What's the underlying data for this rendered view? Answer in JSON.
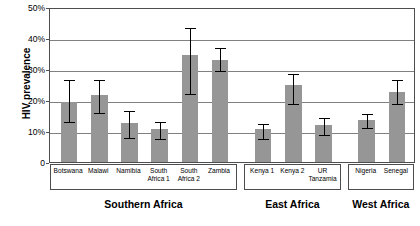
{
  "chart_data": {
    "type": "bar",
    "title": "",
    "xlabel": "",
    "ylabel": "HIV prevalence",
    "ylim": [
      0,
      50
    ],
    "ytick_labels": [
      "0",
      "10%",
      "20%",
      "30%",
      "40%",
      "50%"
    ],
    "ytick_values": [
      0,
      10,
      20,
      30,
      40,
      50
    ],
    "grid": true,
    "legend": "none",
    "units": "percent",
    "categories": [
      "Botswana",
      "Malawi",
      "Namibia",
      "South Africa 1",
      "South Africa 2",
      "Zambia",
      "Kenya 1",
      "Kenya 2",
      "UR Tanzamia",
      "Nigeria",
      "Senegal"
    ],
    "values": [
      19.5,
      21.5,
      12.5,
      10.5,
      34.5,
      33.0,
      10.5,
      25.0,
      12.0,
      13.5,
      22.5
    ],
    "error_low": [
      13.5,
      16.5,
      8.5,
      8.0,
      22.5,
      30.0,
      8.0,
      19.5,
      9.5,
      11.5,
      19.5
    ],
    "error_high": [
      27.0,
      27.0,
      17.0,
      13.5,
      44.0,
      37.5,
      13.0,
      29.0,
      15.0,
      16.0,
      27.0
    ],
    "groups": [
      {
        "label": "Southern Africa",
        "members": [
          "Botswana",
          "Malawi",
          "Namibia",
          "South Africa 1",
          "South Africa 2",
          "Zambia"
        ]
      },
      {
        "label": "East Africa",
        "members": [
          "Kenya 1",
          "Kenya 2",
          "UR Tanzamia"
        ]
      },
      {
        "label": "West Africa",
        "members": [
          "Nigeria",
          "Senegal"
        ]
      }
    ]
  },
  "labels": {
    "categories_display": [
      {
        "line1": "Botswana",
        "line2": ""
      },
      {
        "line1": "Malawi",
        "line2": ""
      },
      {
        "line1": "Namibia",
        "line2": ""
      },
      {
        "line1": "South",
        "line2": "Africa 1"
      },
      {
        "line1": "South",
        "line2": "Africa 2"
      },
      {
        "line1": "Zambia",
        "line2": ""
      },
      {
        "line1": "Kenya 1",
        "line2": ""
      },
      {
        "line1": "Kenya 2",
        "line2": ""
      },
      {
        "line1": "UR",
        "line2": "Tanzamia"
      },
      {
        "line1": "Nigeria",
        "line2": ""
      },
      {
        "line1": "Senegal",
        "line2": ""
      }
    ],
    "y_axis_title": "HIV prevalence",
    "ytick_0": "0",
    "ytick_10": "10%",
    "ytick_20": "20%",
    "ytick_30": "30%",
    "ytick_40": "40%",
    "ytick_50": "50%",
    "group_southern": "Southern Africa",
    "group_east": "East Africa",
    "group_west": "West Africa"
  },
  "colors": {
    "bar_fill": "#969696",
    "grid": "#808080",
    "axis": "#4d4d4d",
    "error": "#000000",
    "background": "#ffffff"
  }
}
